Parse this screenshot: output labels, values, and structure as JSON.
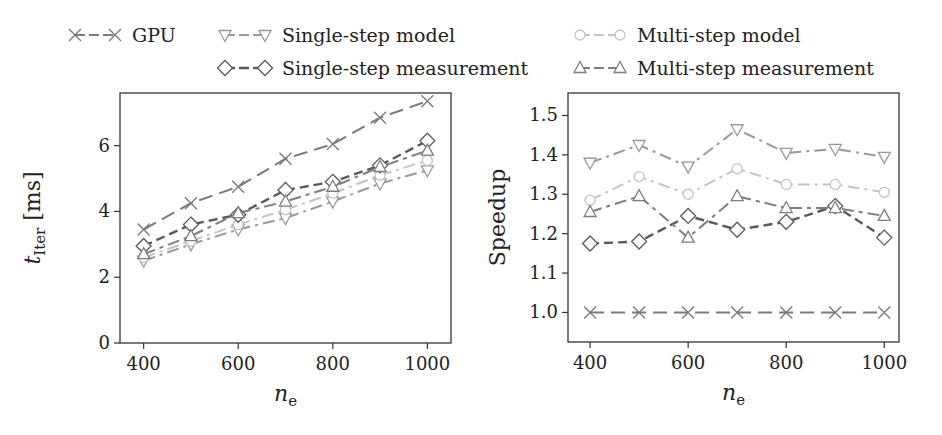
{
  "legend": {
    "items": [
      {
        "key": "gpu",
        "label": "GPU"
      },
      {
        "key": "single_model",
        "label": "Single-step model"
      },
      {
        "key": "multi_model",
        "label": "Multi-step model"
      },
      {
        "key": "single_meas",
        "label": "Single-step measurement"
      },
      {
        "key": "multi_meas",
        "label": "Multi-step measurement"
      }
    ]
  },
  "styles": {
    "gpu": {
      "color": "#7a7a7a",
      "marker": "x",
      "dash": "14,7",
      "width": 2
    },
    "single_model": {
      "color": "#9a9a9a",
      "marker": "tri-down",
      "dash": "12,5,3,5",
      "width": 2
    },
    "multi_model": {
      "color": "#c4c4c4",
      "marker": "circle",
      "dash": "12,5,3,5",
      "width": 2
    },
    "single_meas": {
      "color": "#5a5a5a",
      "marker": "diamond",
      "dash": "9,5",
      "width": 2.4
    },
    "multi_meas": {
      "color": "#7e7e7e",
      "marker": "tri-up",
      "dash": "12,5,4,5",
      "width": 2
    }
  },
  "chart_data": [
    {
      "type": "line",
      "title": "",
      "xlabel": "n_e",
      "ylabel": "t_Iter [ms]",
      "x": [
        400,
        500,
        600,
        700,
        800,
        900,
        1000
      ],
      "xticks": [
        400,
        600,
        800,
        1000
      ],
      "yticks": [
        0,
        2,
        4,
        6
      ],
      "xlim": [
        350,
        1050
      ],
      "ylim": [
        0,
        7.6
      ],
      "grid": false,
      "legend_position": "top",
      "series": [
        {
          "key": "gpu",
          "name": "GPU",
          "values": [
            3.45,
            4.25,
            4.75,
            5.6,
            6.05,
            6.85,
            7.35
          ]
        },
        {
          "key": "single_model",
          "name": "Single-step model",
          "values": [
            2.5,
            3.0,
            3.45,
            3.8,
            4.3,
            4.85,
            5.25
          ]
        },
        {
          "key": "multi_model",
          "name": "Multi-step model",
          "values": [
            2.6,
            3.1,
            3.6,
            4.05,
            4.55,
            5.1,
            5.55
          ]
        },
        {
          "key": "single_meas",
          "name": "Single-step measurement",
          "values": [
            2.95,
            3.6,
            3.9,
            4.65,
            4.9,
            5.4,
            6.15
          ]
        },
        {
          "key": "multi_meas",
          "name": "Multi-step measurement",
          "values": [
            2.7,
            3.25,
            3.95,
            4.3,
            4.75,
            5.35,
            5.85
          ]
        }
      ]
    },
    {
      "type": "line",
      "title": "",
      "xlabel": "n_e",
      "ylabel": "Speedup",
      "x": [
        400,
        500,
        600,
        700,
        800,
        900,
        1000
      ],
      "xticks": [
        400,
        600,
        800,
        1000
      ],
      "yticks": [
        1.0,
        1.1,
        1.2,
        1.3,
        1.4,
        1.5
      ],
      "xlim": [
        355,
        1030
      ],
      "ylim": [
        0.925,
        1.557
      ],
      "grid": false,
      "legend_position": "top",
      "series": [
        {
          "key": "gpu",
          "name": "GPU",
          "values": [
            1.0,
            1.0,
            1.0,
            1.0,
            1.0,
            1.0,
            1.0
          ]
        },
        {
          "key": "single_model",
          "name": "Single-step model",
          "values": [
            1.38,
            1.425,
            1.37,
            1.465,
            1.405,
            1.415,
            1.395
          ]
        },
        {
          "key": "multi_model",
          "name": "Multi-step model",
          "values": [
            1.285,
            1.345,
            1.3,
            1.365,
            1.325,
            1.325,
            1.305
          ]
        },
        {
          "key": "single_meas",
          "name": "Single-step measurement",
          "values": [
            1.175,
            1.18,
            1.245,
            1.21,
            1.23,
            1.27,
            1.19
          ]
        },
        {
          "key": "multi_meas",
          "name": "Multi-step measurement",
          "values": [
            1.255,
            1.295,
            1.19,
            1.295,
            1.265,
            1.265,
            1.245
          ]
        }
      ]
    }
  ],
  "layout": {
    "panels": [
      {
        "box": [
          120,
          93,
          451,
          343
        ],
        "tickfmt": 0
      },
      {
        "box": [
          568,
          93,
          899,
          342
        ],
        "tickfmt": 1
      }
    ],
    "legend_slots": [
      {
        "key": "gpu",
        "x": 75,
        "y": 35
      },
      {
        "key": "single_model",
        "x": 225,
        "y": 35
      },
      {
        "key": "multi_model",
        "x": 580,
        "y": 35
      },
      {
        "key": "single_meas",
        "x": 225,
        "y": 68
      },
      {
        "key": "multi_meas",
        "x": 580,
        "y": 68
      }
    ]
  }
}
